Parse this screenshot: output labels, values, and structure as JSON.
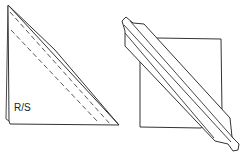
{
  "diagram": {
    "type": "sewing-fold-illustration",
    "panels": [
      {
        "id": "left",
        "shape": "folded-triangle",
        "label": "R/S",
        "stitch_lines": 2
      },
      {
        "id": "right",
        "shape": "square-with-diagonal-strip"
      }
    ],
    "colors": {
      "line": "#333333",
      "background": "#ffffff"
    }
  }
}
